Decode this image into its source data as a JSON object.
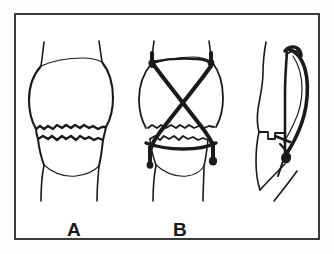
{
  "figure": {
    "background_color": "#ffffff",
    "frame_color": "#3b3b3b",
    "ink_color": "#1a1a1a",
    "panels": [
      {
        "id": "panel-a",
        "label": "A",
        "caption": "Anterior view of knee showing transverse fracture of the patella with separation of fragments",
        "view": "anterior",
        "has_strapping": false
      },
      {
        "id": "panel-b",
        "label": "B",
        "caption": "Anterior view of knee with crossed figure-of-eight adhesive strapping applied over the patella",
        "view": "anterior",
        "has_strapping": true
      },
      {
        "id": "panel-c",
        "label": "",
        "caption": "Lateral view of knee with strapping in place",
        "view": "lateral",
        "has_strapping": true
      }
    ]
  }
}
